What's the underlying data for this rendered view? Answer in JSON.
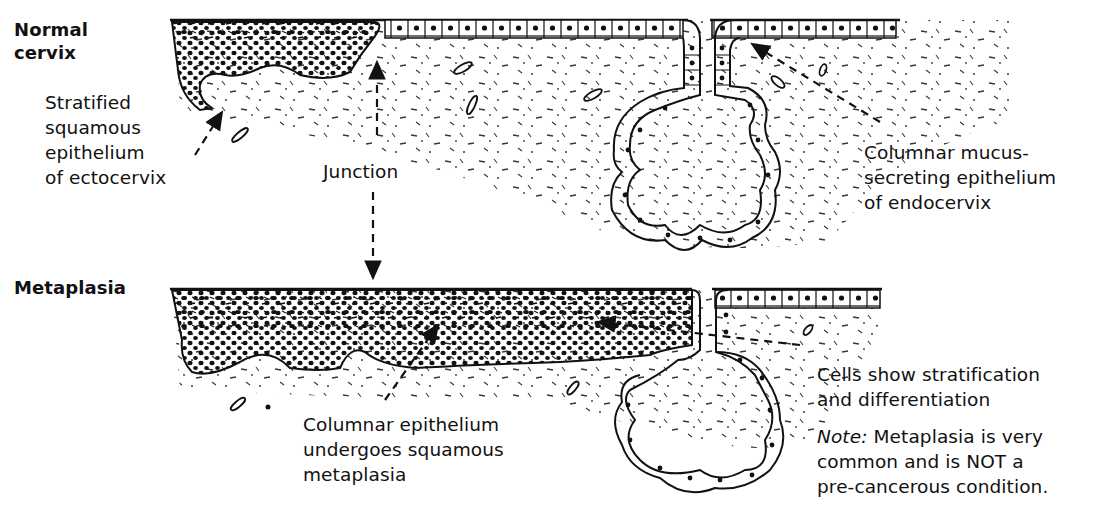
{
  "diagram": {
    "panels": [
      {
        "id": "normal",
        "title_lines": [
          "Normal",
          "cervix"
        ]
      },
      {
        "id": "metaplasia",
        "title_lines": [
          "Metaplasia"
        ]
      }
    ],
    "labels": {
      "stratified": [
        "Stratified",
        "squamous",
        "epithelium",
        "of ectocervix"
      ],
      "junction": "Junction",
      "columnar_mucus": [
        "Columnar mucus-",
        "secreting epithelium",
        "of endocervix"
      ],
      "columnar_undergoes": [
        "Columnar epithelium",
        "undergoes squamous",
        "metaplasia"
      ],
      "cells_show": [
        "Cells show stratification",
        "and differentiation"
      ],
      "note": {
        "prefix": "Note:",
        "line1_rest": " Metaplasia is very",
        "line2": "common and is NOT a",
        "line3": "pre-cancerous condition."
      }
    },
    "colors": {
      "ink": "#111111",
      "background": "#ffffff"
    }
  }
}
